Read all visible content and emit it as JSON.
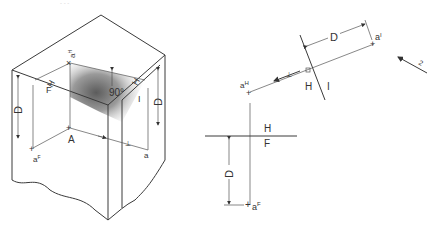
{
  "caption_fragment": "- - -",
  "pictorial": {
    "labels": {
      "top_point": "a",
      "top_point_sup": "H",
      "fold_line_label": "H",
      "fold_line_label2": "F",
      "angle": "90°",
      "right_face_label": "H",
      "right_face_label2": "I",
      "depth_left": "D",
      "depth_right": "D",
      "point_A": "A",
      "point_aF": "a",
      "point_aF_sup": "F",
      "point_a1": "a",
      "point_a1_sup": "I",
      "perp_mark": "⊥"
    }
  },
  "orthographic": {
    "labels": {
      "aH": "a",
      "aH_sup": "H",
      "a1": "a",
      "a1_sup": "I",
      "D_aux": "D",
      "fold_HI_left": "H",
      "fold_HI_right": "I",
      "fold_HF_top": "H",
      "fold_HF_bottom": "F",
      "D_front": "D",
      "aF": "a",
      "aF_sup": "F",
      "view_arrow_label": "2",
      "perp_mark": "⊥"
    }
  },
  "colors": {
    "line": "#3a3a3a",
    "shade": "#6e6e6e",
    "background": "#ffffff"
  }
}
